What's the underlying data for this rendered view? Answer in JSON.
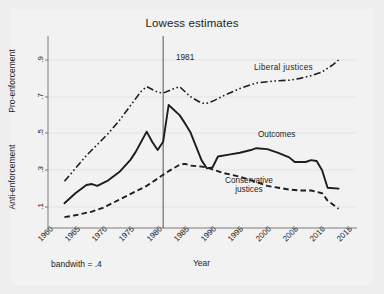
{
  "figure": {
    "title": "Lowess estimates",
    "footnote": "bandwith = .4"
  },
  "axes": {
    "xlabel": "Year",
    "ylabel_top": "Pro-enforcement",
    "ylabel_bottom": "Anti-enforcement",
    "yticks": [
      ".1",
      ".3",
      ".5",
      ".7",
      ".9"
    ],
    "xticks": [
      "1960",
      "1965",
      "1970",
      "1975",
      "1980",
      "1985",
      "1990",
      "1995",
      "2000",
      "2005",
      "2010",
      "2015"
    ]
  },
  "annotations": {
    "reference_year": "1981",
    "liberal": "Liberal  justices",
    "outcomes": "Outcomes",
    "conservative_line1": "Conservative",
    "conservative_line2": "justices"
  },
  "chart_data": {
    "type": "line",
    "title": "Lowess estimates",
    "xlabel": "Year",
    "ylabel": "Pro-enforcement / Anti-enforcement",
    "xlim": [
      1960,
      2016
    ],
    "ylim": [
      0.0,
      0.97
    ],
    "grid": true,
    "legend": "inline-annotations",
    "annotations": [
      {
        "text": "1981",
        "type": "vertical-reference-line",
        "x": 1981
      }
    ],
    "series": [
      {
        "name": "Liberal justices",
        "style": "dash-dot-dot",
        "x": [
          1963,
          1965,
          1967,
          1969,
          1971,
          1973,
          1975,
          1977,
          1978,
          1980,
          1981,
          1983,
          1984,
          1986,
          1988,
          1989,
          1990,
          1992,
          1995,
          1998,
          2001,
          2004,
          2006,
          2008,
          2010,
          2012,
          2013
        ],
        "y": [
          0.24,
          0.31,
          0.38,
          0.44,
          0.5,
          0.57,
          0.65,
          0.73,
          0.755,
          0.725,
          0.72,
          0.745,
          0.755,
          0.7,
          0.665,
          0.665,
          0.675,
          0.705,
          0.745,
          0.775,
          0.785,
          0.79,
          0.8,
          0.815,
          0.835,
          0.875,
          0.9
        ]
      },
      {
        "name": "Outcomes",
        "style": "solid",
        "x": [
          1963,
          1965,
          1967,
          1968,
          1969,
          1971,
          1973,
          1975,
          1976,
          1977,
          1978,
          1979,
          1980,
          1981,
          1982,
          1984,
          1985,
          1986,
          1987,
          1988,
          1989,
          1990,
          1991,
          1993,
          1995,
          1997,
          1998,
          2000,
          2002,
          2004,
          2005,
          2007,
          2008,
          2009,
          2010,
          2011,
          2013
        ],
        "y": [
          0.12,
          0.175,
          0.22,
          0.225,
          0.215,
          0.245,
          0.29,
          0.355,
          0.4,
          0.455,
          0.51,
          0.455,
          0.41,
          0.455,
          0.655,
          0.6,
          0.555,
          0.505,
          0.43,
          0.355,
          0.31,
          0.315,
          0.375,
          0.385,
          0.395,
          0.41,
          0.42,
          0.415,
          0.395,
          0.37,
          0.345,
          0.345,
          0.355,
          0.35,
          0.3,
          0.205,
          0.2
        ]
      },
      {
        "name": "Conservative justices",
        "style": "dashed",
        "x": [
          1963,
          1965,
          1968,
          1970,
          1972,
          1974,
          1976,
          1978,
          1980,
          1982,
          1984,
          1985,
          1986,
          1988,
          1989,
          1990,
          1992,
          1995,
          1998,
          2000,
          2002,
          2004,
          2006,
          2008,
          2010,
          2011,
          2013
        ],
        "y": [
          0.045,
          0.055,
          0.075,
          0.095,
          0.125,
          0.155,
          0.185,
          0.215,
          0.255,
          0.295,
          0.33,
          0.335,
          0.325,
          0.32,
          0.315,
          0.305,
          0.285,
          0.265,
          0.235,
          0.215,
          0.205,
          0.195,
          0.19,
          0.19,
          0.175,
          0.135,
          0.09
        ]
      }
    ]
  }
}
